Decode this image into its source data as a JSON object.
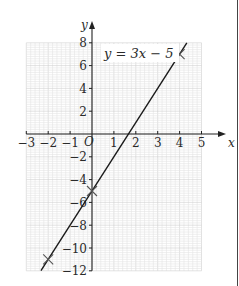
{
  "chart_data": {
    "type": "line",
    "title": "",
    "equation_label": "y = 3x − 5",
    "xlabel": "x",
    "ylabel": "y",
    "origin_label": "O",
    "xlim": [
      -3,
      5
    ],
    "ylim": [
      -12,
      8
    ],
    "x_ticks": [
      -3,
      -2,
      -1,
      1,
      2,
      3,
      4,
      5
    ],
    "x_tick_labels": [
      "−3",
      "−2",
      "−1",
      "1",
      "2",
      "3",
      "4",
      "5"
    ],
    "y_ticks": [
      8,
      6,
      4,
      2,
      -2,
      -4,
      -6,
      -8,
      -10,
      -12
    ],
    "y_tick_labels": [
      "8",
      "6",
      "4",
      "2",
      "−2",
      "−4",
      "−6",
      "−8",
      "−10",
      "−12"
    ],
    "grid": true,
    "minor_grid_step": 0.2,
    "series": [
      {
        "name": "y = 3x − 5",
        "slope": 3,
        "intercept": -5,
        "line_x_range": [
          -2.33,
          4.33
        ],
        "marked_points": [
          {
            "x": -2,
            "y": -11
          },
          {
            "x": 0,
            "y": -5
          },
          {
            "x": 4,
            "y": 7
          }
        ]
      }
    ]
  },
  "colors": {
    "grid_minor": "#e4e4e4",
    "grid_major": "#cfcfcf",
    "axis": "#222222",
    "line": "#1a1a1a",
    "text": "#2a2a2a"
  }
}
